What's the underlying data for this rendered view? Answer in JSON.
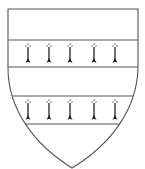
{
  "figure": {
    "blazon": "two bars ermine",
    "field_tincture": "argent",
    "charges": [
      {
        "name": "bar",
        "tincture": "ermine",
        "spot_count": 5
      },
      {
        "name": "bar",
        "tincture": "ermine",
        "spot_count": 5
      }
    ]
  },
  "colors": {
    "outline": "#555555",
    "field": "#ffffff",
    "ermine_spot": "#1a1a1a"
  }
}
